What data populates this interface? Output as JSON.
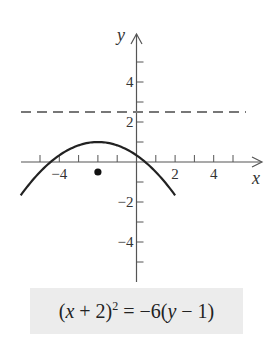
{
  "chart_data": {
    "type": "line",
    "title": "",
    "xlabel": "x",
    "ylabel": "y",
    "xlim": [
      -6,
      6.5
    ],
    "ylim": [
      -6,
      6.5
    ],
    "grid": false,
    "x_ticks": [
      -5,
      -4,
      -3,
      -2,
      -1,
      1,
      2,
      3,
      4,
      5
    ],
    "x_tick_labels": [
      {
        "value": -4,
        "label": "−4"
      },
      {
        "value": 2,
        "label": "2"
      },
      {
        "value": 4,
        "label": "4"
      }
    ],
    "y_ticks": [
      -5,
      -4,
      -3,
      -2,
      -1,
      1,
      2,
      3,
      4,
      5
    ],
    "y_tick_labels": [
      {
        "value": 4,
        "label": "4"
      },
      {
        "value": 2,
        "label": "2"
      },
      {
        "value": -2,
        "label": "−2"
      },
      {
        "value": -4,
        "label": "−4"
      }
    ],
    "series": [
      {
        "name": "parabola",
        "equation": "(x + 2)^2 = -6(y - 1)",
        "style": "solid",
        "vertex": [
          -2,
          1
        ],
        "x_range": [
          -6,
          2
        ]
      },
      {
        "name": "directrix",
        "equation": "y = 2.5",
        "style": "dashed",
        "y": 2.5,
        "x_range": [
          -6,
          5.7
        ]
      },
      {
        "name": "focus",
        "style": "point",
        "points": [
          [
            -2,
            -0.5
          ]
        ]
      }
    ]
  },
  "equation_box": {
    "open": "(",
    "x": "x",
    "plus": " + 2)",
    "exp": "2",
    "rest_a": " = −6(",
    "y": "y",
    "rest_b": " − 1)"
  }
}
